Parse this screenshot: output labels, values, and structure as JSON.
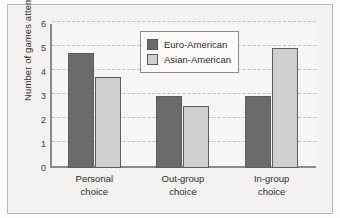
{
  "chart_data": {
    "type": "bar",
    "title": "",
    "subtitle": "",
    "xlabel": "",
    "ylabel": "Number of games attempted",
    "categories": [
      "Personal choice",
      "Out-group choice",
      "In-group choice"
    ],
    "category_lines": [
      [
        "Personal",
        "choice"
      ],
      [
        "Out-group",
        "choice"
      ],
      [
        "In-group",
        "choice"
      ]
    ],
    "series": [
      {
        "name": "Euro-American",
        "values": [
          4.8,
          3.0,
          3.0
        ],
        "color": "#6b6b6b"
      },
      {
        "name": "Asian-American",
        "values": [
          3.8,
          2.6,
          5.0
        ],
        "color": "#cfcfcf"
      }
    ],
    "ylim": [
      0,
      6
    ],
    "yticks": [
      0,
      1,
      2,
      3,
      4,
      5,
      6
    ],
    "ytick_labels": [
      "0",
      "1",
      "2",
      "3",
      "4",
      "5",
      "6"
    ],
    "grid": true,
    "grid_style": "dashed",
    "grid_color": "#c2c0bc",
    "legend_position": "top-center",
    "axis_color": "#8d8b87",
    "plot_background": "#f7f6f4",
    "figure_background": "#f3f2f0",
    "bar_edge_color": "#5e5c59"
  }
}
